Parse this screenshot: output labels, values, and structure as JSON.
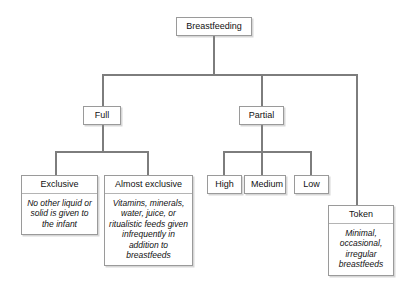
{
  "diagram": {
    "type": "tree",
    "root": {
      "id": "breastfeeding",
      "label": "Breastfeeding"
    },
    "level2": [
      {
        "id": "full",
        "label": "Full"
      },
      {
        "id": "partial",
        "label": "Partial"
      },
      {
        "id": "token",
        "label": "Token",
        "description": "Minimal, occasional, irregular breastfeeds"
      }
    ],
    "full_children": [
      {
        "id": "exclusive",
        "label": "Exclusive",
        "description": "No other liquid or solid is given to the infant"
      },
      {
        "id": "almost-exclusive",
        "label": "Almost exclusive",
        "description": "Vitamins, minerals, water, juice, or ritualistic feeds given infrequently in addition to breastfeeds"
      }
    ],
    "partial_children": [
      {
        "id": "high",
        "label": "High"
      },
      {
        "id": "medium",
        "label": "Medium"
      },
      {
        "id": "low",
        "label": "Low"
      }
    ],
    "colors": {
      "connector": "#7d7d7d",
      "box_border": "#9a9a9a",
      "background": "#ffffff",
      "text": "#111111"
    }
  }
}
